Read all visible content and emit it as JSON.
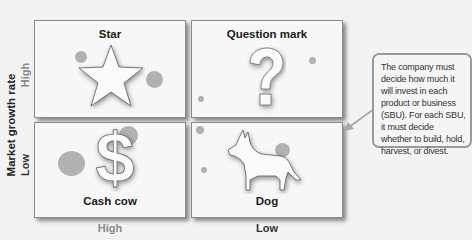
{
  "axes": {
    "y_title": "Market growth rate",
    "y_high": "High",
    "y_low": "Low",
    "x_high": "High",
    "x_low": "Low"
  },
  "quadrants": [
    {
      "id": "star",
      "label": "Star",
      "icon": "star-icon"
    },
    {
      "id": "question-mark",
      "label": "Question mark",
      "icon": "question-mark-icon"
    },
    {
      "id": "cash-cow",
      "label": "Cash cow",
      "icon": "dollar-sign-icon"
    },
    {
      "id": "dog",
      "label": "Dog",
      "icon": "dog-icon"
    }
  ],
  "callout": {
    "text": "The company must decide how much it will invest in each product or business (SBU). For each SBU, it must decide whether to build, hold, harvest, or divest."
  },
  "colors": {
    "bubble": "#a8a8a8",
    "tick_high_y": "#8a8a8a",
    "tick_x_high": "#8a8a8a",
    "tick_x_low": "#333333"
  }
}
